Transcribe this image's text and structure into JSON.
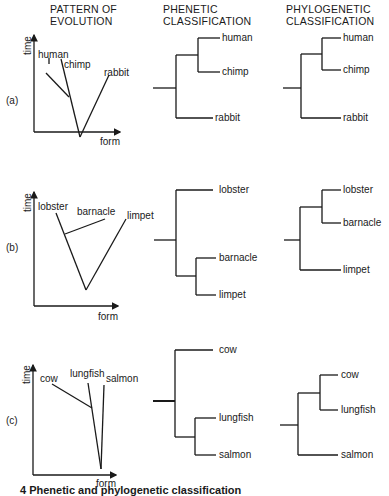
{
  "headers": {
    "evolution": "PATTERN OF\nEVOLUTION",
    "phenetic": "PHENETIC\nCLASSIFICATION",
    "phylogenetic": "PHYLOGENETIC\nCLASSIFICATION"
  },
  "axes": {
    "y_label": "time",
    "x_label": "form"
  },
  "rows": [
    {
      "label": "(a)",
      "taxa": [
        "human",
        "chimp",
        "rabbit"
      ],
      "phenetic": {
        "top": "human",
        "mid": "chimp",
        "bottom": "rabbit"
      },
      "phylogenetic": {
        "top": "human",
        "mid": "chimp",
        "bottom": "rabbit"
      }
    },
    {
      "label": "(b)",
      "taxa": [
        "lobster",
        "barnacle",
        "limpet"
      ],
      "phenetic": {
        "top": "lobster",
        "mid": "barnacle",
        "bottom": "limpet"
      },
      "phylogenetic": {
        "top": "lobster",
        "mid": "barnacle",
        "bottom": "limpet"
      }
    },
    {
      "label": "(c)",
      "taxa": [
        "cow",
        "lungfish",
        "salmon"
      ],
      "phenetic": {
        "top": "cow",
        "mid": "lungfish",
        "bottom": "salmon"
      },
      "phylogenetic": {
        "top": "cow",
        "mid": "lungfish",
        "bottom": "salmon"
      }
    }
  ],
  "caption": "4 Phenetic and phylogenetic classification"
}
